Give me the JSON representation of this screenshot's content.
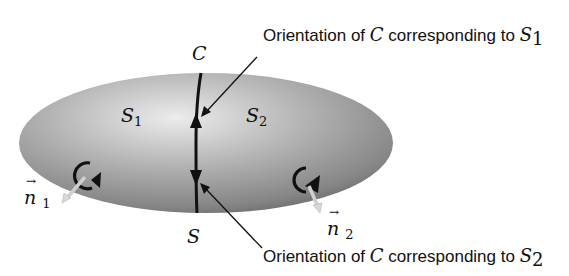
{
  "figure": {
    "type": "surface-orientation-diagram",
    "curve_label": "C",
    "surface_label": "S",
    "regions": [
      {
        "label": "S",
        "sub": "1"
      },
      {
        "label": "S",
        "sub": "2"
      }
    ],
    "normals": [
      {
        "label": "n",
        "sub": "1",
        "vector_arrow": "→"
      },
      {
        "label": "n",
        "sub": "2",
        "vector_arrow": "→"
      }
    ],
    "annotations": [
      {
        "prefix": "Orientation of ",
        "var": "C",
        "middle": " corresponding to ",
        "sym": "S",
        "sub": "1"
      },
      {
        "prefix": "Orientation of ",
        "var": "C",
        "middle": " corresponding to ",
        "sym": "S",
        "sub": "2"
      }
    ],
    "colors": {
      "surface_light": "#e6e6e6",
      "surface_mid": "#a9a9a9",
      "surface_dark": "#6e6e6e",
      "ink": "#111111",
      "normal_arrow": "#d8d8d8"
    }
  }
}
